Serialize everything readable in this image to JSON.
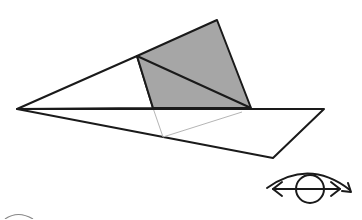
{
  "diagram": {
    "type": "paper-folding-view",
    "colors": {
      "background": "#ffffff",
      "stroke": "#1a1a1a",
      "fold_fill": "#a6a6a6",
      "hidden_line": "#b5b5b5"
    },
    "shapes": {
      "left_triangle": [
        [
          17,
          109
        ],
        [
          137,
          56
        ],
        [
          153,
          108
        ]
      ],
      "folded_quad": [
        [
          137,
          56
        ],
        [
          217,
          20
        ],
        [
          251,
          108
        ],
        [
          153,
          108
        ]
      ],
      "fold_diagonal": [
        [
          137,
          56
        ],
        [
          251,
          108
        ]
      ],
      "lower_sheet": [
        [
          17,
          109
        ],
        [
          324,
          109
        ],
        [
          273,
          158
        ]
      ],
      "hidden_lines": [
        [
          [
            153,
            108
          ],
          [
            163,
            137
          ]
        ],
        [
          [
            163,
            137
          ],
          [
            242,
            112
          ]
        ]
      ]
    },
    "view_indicator": {
      "icon": "eye-rotate-icon",
      "circle": {
        "cx": 310,
        "cy": 189,
        "r": 14
      }
    },
    "partial_marker": {
      "icon": "partial-circle-icon"
    }
  }
}
